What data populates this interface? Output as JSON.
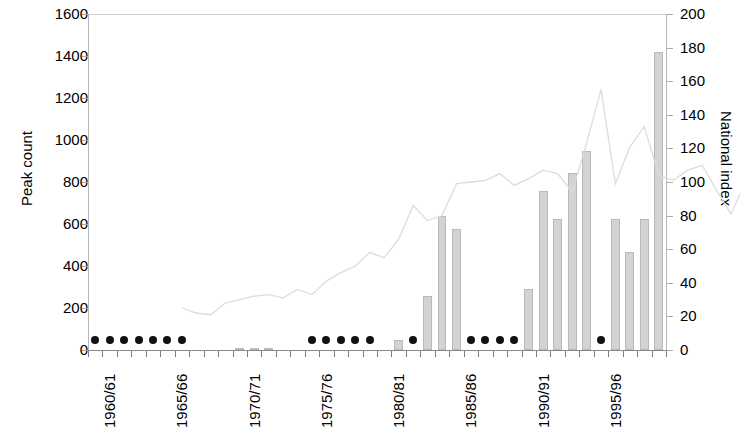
{
  "chart_data": {
    "type": "bar",
    "title": "",
    "subtitle": "",
    "xlabel": "",
    "ylabel": "Peak count",
    "y2label": "National index",
    "ylim": [
      0,
      1600
    ],
    "y2lim": [
      0,
      200
    ],
    "grid": false,
    "legend": "none",
    "y_ticks": [
      "0",
      "200",
      "400",
      "600",
      "800",
      "1000",
      "1200",
      "1400",
      "1600"
    ],
    "y_tick_values": [
      0,
      200,
      400,
      600,
      800,
      1000,
      1200,
      1400,
      1600
    ],
    "y2_ticks": [
      "0",
      "20",
      "40",
      "60",
      "80",
      "100",
      "120",
      "140",
      "160",
      "180",
      "200"
    ],
    "y2_tick_values": [
      0,
      20,
      40,
      60,
      80,
      100,
      120,
      140,
      160,
      180,
      200
    ],
    "categories": [
      "1960/61",
      "1961/62",
      "1962/63",
      "1963/64",
      "1964/65",
      "1965/66",
      "1966/67",
      "1967/68",
      "1968/69",
      "1969/70",
      "1970/71",
      "1971/72",
      "1972/73",
      "1973/74",
      "1974/75",
      "1975/76",
      "1976/77",
      "1977/78",
      "1978/79",
      "1979/80",
      "1980/81",
      "1981/82",
      "1982/83",
      "1983/84",
      "1984/85",
      "1985/86",
      "1986/87",
      "1987/88",
      "1988/89",
      "1989/90",
      "1990/91",
      "1991/92",
      "1992/93",
      "1993/94",
      "1994/95",
      "1995/96",
      "1996/97",
      "1997/98",
      "1998/99"
    ],
    "x_tick_labels_shown": [
      "1960/61",
      "1965/66",
      "1970/71",
      "1975/76",
      "1980/81",
      "1985/86",
      "1990/91",
      "1995/96"
    ],
    "x_tick_label_indices": [
      0,
      5,
      10,
      15,
      20,
      25,
      30,
      35
    ],
    "series": [
      {
        "name": "Peak count",
        "type": "bar",
        "axis": "left",
        "color": "#d3d3d3",
        "edge_color": "#b9b9b9",
        "values": [
          0,
          0,
          0,
          0,
          0,
          0,
          0,
          null,
          null,
          null,
          6,
          6,
          6,
          null,
          null,
          0,
          0,
          0,
          0,
          0,
          0,
          50,
          0,
          255,
          640,
          575,
          0,
          0,
          0,
          0,
          290,
          755,
          625,
          845,
          950,
          0,
          625,
          465,
          625
        ],
        "extra_value_after_last_tick": 1420,
        "note_markers": "Solid black dots mark years with zero / no peak count"
      },
      {
        "name": "National index",
        "type": "line",
        "axis": "right",
        "color": "#dcdcdc",
        "values": [
          null,
          null,
          null,
          null,
          null,
          null,
          25,
          22,
          21,
          28,
          30,
          32,
          33,
          31,
          36,
          33,
          41,
          46,
          50,
          58,
          55,
          66,
          86,
          77,
          80,
          99,
          100,
          101,
          105,
          98,
          102,
          107,
          105,
          94,
          123,
          155,
          99,
          121,
          133
        ],
        "tail_values": [
          104,
          101,
          107,
          110,
          95,
          81,
          100,
          178
        ]
      }
    ]
  },
  "marker_years": {
    "zero_dot_indices": [
      0,
      1,
      2,
      3,
      4,
      5,
      6,
      15,
      16,
      17,
      18,
      19,
      22,
      26,
      27,
      28,
      29,
      35
    ],
    "dot_color": "#111111"
  },
  "axes": {
    "left_title": "Peak count",
    "right_title": "National index"
  }
}
